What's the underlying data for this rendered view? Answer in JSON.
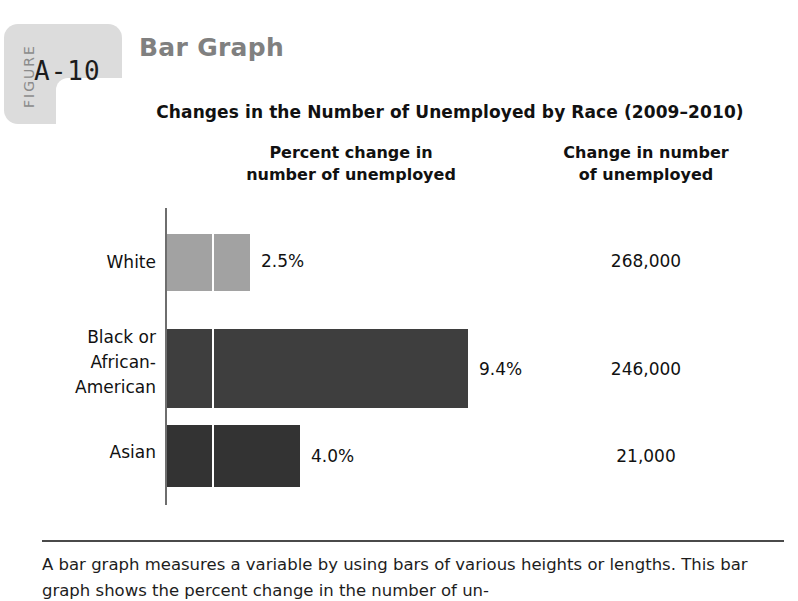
{
  "figure": {
    "label_word": "FIGURE",
    "number": "A-10",
    "heading": "Bar Graph"
  },
  "chart_data": {
    "type": "bar",
    "orientation": "horizontal",
    "title": "Changes in the Number of Unemployed by Race (2009–2010)",
    "column_headers": {
      "percent": "Percent change in\nnumber of unemployed",
      "percent_line1": "Percent change in",
      "percent_line2": "number of unemployed",
      "count": "Change in number\nof unemployed",
      "count_line1": "Change in number",
      "count_line2": "of unemployed"
    },
    "categories": [
      "White",
      "Black or African-American",
      "Asian"
    ],
    "category_labels": [
      "White",
      "Black or\nAfrican-\nAmerican",
      "Asian"
    ],
    "values": [
      2.5,
      9.4,
      4.0
    ],
    "value_labels": [
      "2.5%",
      "4.0%",
      "9.4%"
    ],
    "bars": [
      {
        "label": "White",
        "label_line1": "White",
        "label_line2": "",
        "label_line3": "",
        "percent": 2.5,
        "percent_label": "2.5%",
        "count": 268000,
        "count_label": "268,000",
        "color": "#a2a2a2"
      },
      {
        "label": "Black or African-American",
        "label_line1": "Black or",
        "label_line2": "African-",
        "label_line3": "American",
        "percent": 9.4,
        "percent_label": "9.4%",
        "count": 246000,
        "count_label": "246,000",
        "color": "#3e3e3e"
      },
      {
        "label": "Asian",
        "label_line1": "Asian",
        "label_line2": "",
        "label_line3": "",
        "percent": 4.0,
        "percent_label": "4.0%",
        "count": 21000,
        "count_label": "21,000",
        "color": "#333333"
      }
    ],
    "xlabel": "",
    "ylabel": "",
    "xlim": [
      0,
      10
    ],
    "grid": false,
    "legend": "none"
  },
  "caption": {
    "text": "A bar graph measures a variable by using bars of various heights or lengths. This bar graph shows the percent change in the number of un-"
  },
  "colors": {
    "tab_background": "#dcdcdc",
    "heading": "#808080",
    "axis": "#6e6e6e",
    "text": "#111111"
  }
}
